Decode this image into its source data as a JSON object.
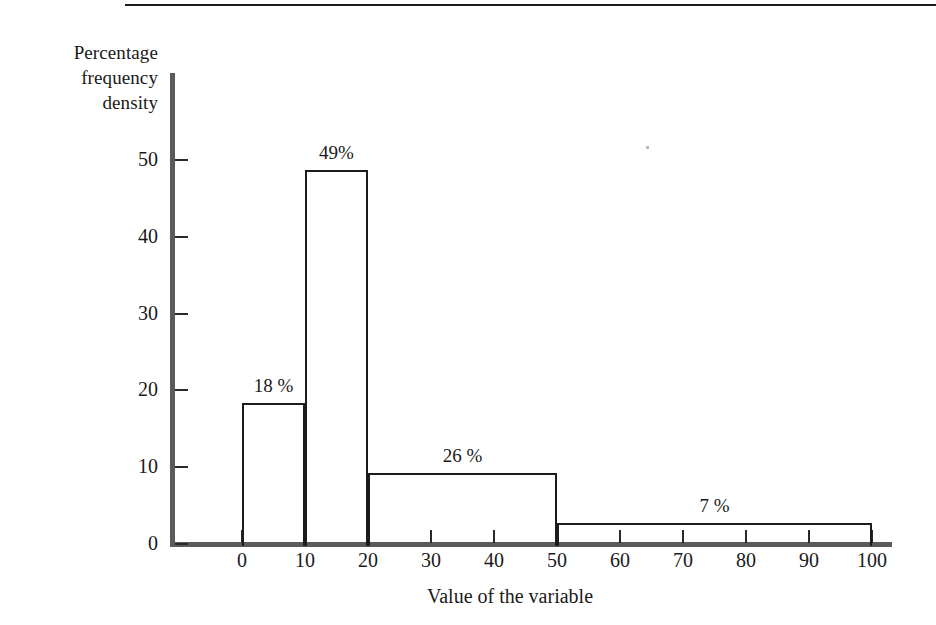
{
  "figure": {
    "decorations": {
      "top_rule": "horizontal-rule"
    }
  },
  "chart_data": {
    "type": "bar",
    "subtype": "histogram",
    "title": "",
    "xlabel": "Value of the variable",
    "ylabel": "Percentage\nfrequency\ndensity",
    "xlim": [
      0,
      100
    ],
    "ylim": [
      0,
      50
    ],
    "xticks": [
      0,
      10,
      20,
      30,
      40,
      50,
      60,
      70,
      80,
      90,
      100
    ],
    "xtick_labels": [
      "0",
      "10",
      "20",
      "30",
      "40",
      "50",
      "60",
      "70",
      "80",
      "90",
      "100"
    ],
    "yticks": [
      0,
      10,
      20,
      30,
      40,
      50
    ],
    "ytick_labels": [
      "0",
      "10",
      "20",
      "30",
      "40",
      "50"
    ],
    "grid": false,
    "legend": null,
    "bars": [
      {
        "bin_start": 0,
        "bin_end": 10,
        "bin_width": 10,
        "percentage": 18,
        "label": "18 %",
        "frequency_density": 18.4
      },
      {
        "bin_start": 10,
        "bin_end": 20,
        "bin_width": 10,
        "percentage": 49,
        "label": "49%",
        "frequency_density": 48.7
      },
      {
        "bin_start": 20,
        "bin_end": 50,
        "bin_width": 30,
        "percentage": 26,
        "label": "26 %",
        "frequency_density": 9.2
      },
      {
        "bin_start": 50,
        "bin_end": 100,
        "bin_width": 50,
        "percentage": 7,
        "label": "7 %",
        "frequency_density": 2.7
      }
    ],
    "colors": {
      "bar_outline": "#1c1c1c",
      "bar_fill": "#ffffff",
      "axis": "#5b5b5b",
      "text": "#1a1a1a",
      "background": "#ffffff"
    }
  }
}
